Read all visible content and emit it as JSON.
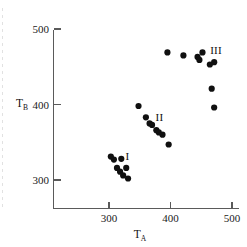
{
  "figure": {
    "background_color": "#ffffff",
    "ink_color": "#101010",
    "axis_color": "#5a5a5a"
  },
  "chart_data": {
    "type": "scatter",
    "title": "",
    "subtitle": "",
    "xlabel": "T_A",
    "ylabel": "T_B",
    "xlabel_base": "T",
    "xlabel_sub": "A",
    "ylabel_base": "T",
    "ylabel_sub": "B",
    "xlim": [
      262,
      247
    ],
    "x_axis_min": 262,
    "x_axis_max": 512,
    "y_axis_min": 252,
    "y_axis_max": 512,
    "xticks": [
      300,
      400,
      500
    ],
    "xtick_labels": [
      "300",
      "400",
      "500"
    ],
    "yticks": [
      300,
      400,
      500
    ],
    "ytick_labels": [
      "300",
      "400",
      "500"
    ],
    "grid": false,
    "legend": "none",
    "marker": "filled-circle",
    "marker_size_px": 3.1,
    "annotations": [
      {
        "text": "I",
        "x": 330,
        "y": 332
      },
      {
        "text": "II",
        "x": 382,
        "y": 383
      },
      {
        "text": "III",
        "x": 474,
        "y": 472
      }
    ],
    "series": [
      {
        "name": "I",
        "label": "I",
        "points": [
          {
            "x": 303,
            "y": 331
          },
          {
            "x": 308,
            "y": 327
          },
          {
            "x": 320,
            "y": 328
          },
          {
            "x": 313,
            "y": 316
          },
          {
            "x": 318,
            "y": 311
          },
          {
            "x": 328,
            "y": 316
          },
          {
            "x": 323,
            "y": 306
          },
          {
            "x": 331,
            "y": 302
          }
        ]
      },
      {
        "name": "II",
        "label": "II",
        "points": [
          {
            "x": 348,
            "y": 398
          },
          {
            "x": 360,
            "y": 383
          },
          {
            "x": 366,
            "y": 375
          },
          {
            "x": 370,
            "y": 373
          },
          {
            "x": 377,
            "y": 366
          },
          {
            "x": 381,
            "y": 363
          },
          {
            "x": 387,
            "y": 360
          },
          {
            "x": 397,
            "y": 347
          }
        ]
      },
      {
        "name": "III",
        "label": "III",
        "points": [
          {
            "x": 395,
            "y": 469
          },
          {
            "x": 421,
            "y": 465
          },
          {
            "x": 444,
            "y": 463
          },
          {
            "x": 447,
            "y": 459
          },
          {
            "x": 452,
            "y": 469
          },
          {
            "x": 464,
            "y": 453
          },
          {
            "x": 471,
            "y": 456
          },
          {
            "x": 467,
            "y": 421
          },
          {
            "x": 471,
            "y": 396
          }
        ]
      }
    ]
  }
}
